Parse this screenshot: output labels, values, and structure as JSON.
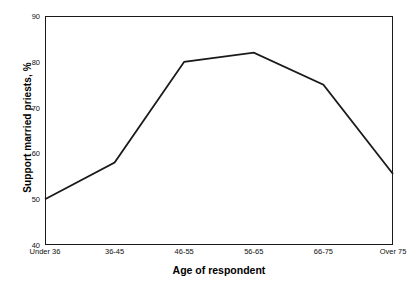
{
  "chart_data": {
    "type": "line",
    "title": "",
    "subtitle": "",
    "xlabel": "Age of respondent",
    "ylabel": "Support married priests, %",
    "categories": [
      "Under 36",
      "36-45",
      "46-55",
      "56-65",
      "66-75",
      "Over 75"
    ],
    "values": [
      50,
      58,
      80,
      82,
      75,
      55.5
    ],
    "series": [
      {
        "name": "Support married priests",
        "values": [
          50,
          58,
          80,
          82,
          75,
          55.5
        ]
      }
    ],
    "ylim": [
      40,
      90
    ],
    "yticks": [
      40,
      50,
      60,
      70,
      80,
      90
    ],
    "ytick_labels": [
      "40",
      "50",
      "60",
      "70",
      "80",
      "90"
    ],
    "grid": false,
    "legend": false,
    "legend_position": "none",
    "markers": false,
    "line_color": "#1a1a1a",
    "frame_color": "#1a1a1a",
    "background_color": "#ffffff",
    "annotations": []
  }
}
